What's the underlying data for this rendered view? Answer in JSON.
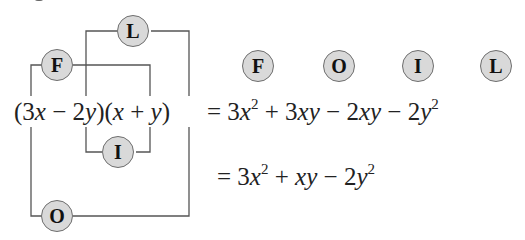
{
  "diagram": {
    "title_fragment": "",
    "labels": {
      "first": "F",
      "outer": "O",
      "inner": "I",
      "last": "L"
    },
    "expression": {
      "left_side": [
        "(3",
        "x",
        " − 2",
        "y",
        ")(",
        "x",
        " + ",
        "y",
        ")"
      ],
      "line1": [
        "= 3",
        "x",
        "2",
        " + 3",
        "xy",
        " − 2",
        "xy",
        " − 2",
        "y",
        "2"
      ],
      "line2": [
        "= 3",
        "x",
        "2",
        " + ",
        "xy",
        " − 2",
        "y",
        "2"
      ]
    },
    "legend_order": [
      "F",
      "O",
      "I",
      "L"
    ],
    "colors": {
      "badge_fill": "#d9d9d9",
      "badge_border": "#6e6e6e",
      "line": "#555555",
      "text": "#222222"
    }
  }
}
